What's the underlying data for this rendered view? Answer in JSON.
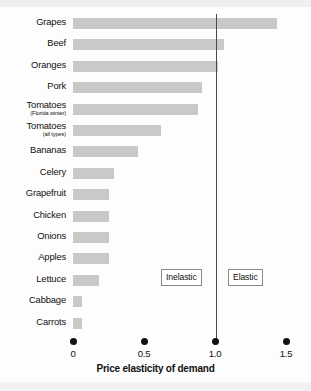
{
  "chart_data": {
    "type": "bar",
    "orientation": "horizontal",
    "title": "",
    "xlabel": "Price elasticity of demand",
    "ylabel": "",
    "xlim": [
      0,
      1.5
    ],
    "xticks": [
      "0",
      "0.5",
      "1.0",
      "1.5"
    ],
    "xtick_values": [
      0,
      0.5,
      1.0,
      1.5
    ],
    "grid": false,
    "legend": null,
    "bar_color": "#c9c9c9",
    "reference_line": {
      "value": 1.0,
      "color": "#4a4a4a",
      "label": "unit elasticity"
    },
    "annotations": [
      {
        "text": "Inelastic",
        "x": 0.62
      },
      {
        "text": "Elastic",
        "x": 1.1
      }
    ],
    "categories": [
      "Grapes",
      "Beef",
      "Oranges",
      "Pork",
      "Tomatoes (Florida winter)",
      "Tomatoes (all types)",
      "Bananas",
      "Celery",
      "Grapefruit",
      "Chicken",
      "Onions",
      "Apples",
      "Lettuce",
      "Cabbage",
      "Carrots"
    ],
    "values": [
      1.44,
      1.06,
      1.02,
      0.91,
      0.88,
      0.62,
      0.46,
      0.29,
      0.25,
      0.25,
      0.25,
      0.25,
      0.18,
      0.06,
      0.06
    ]
  },
  "rows": [
    {
      "label": "Grapes",
      "sub": "",
      "value": 1.44
    },
    {
      "label": "Beef",
      "sub": "",
      "value": 1.06
    },
    {
      "label": "Oranges",
      "sub": "",
      "value": 1.02
    },
    {
      "label": "Pork",
      "sub": "",
      "value": 0.91
    },
    {
      "label": "Tomatoes",
      "sub": "(Florida winter)",
      "value": 0.88
    },
    {
      "label": "Tomatoes",
      "sub": "(all types)",
      "value": 0.62
    },
    {
      "label": "Bananas",
      "sub": "",
      "value": 0.46
    },
    {
      "label": "Celery",
      "sub": "",
      "value": 0.29
    },
    {
      "label": "Grapefruit",
      "sub": "",
      "value": 0.25
    },
    {
      "label": "Chicken",
      "sub": "",
      "value": 0.25
    },
    {
      "label": "Onions",
      "sub": "",
      "value": 0.25
    },
    {
      "label": "Apples",
      "sub": "",
      "value": 0.25
    },
    {
      "label": "Lettuce",
      "sub": "",
      "value": 0.18
    },
    {
      "label": "Cabbage",
      "sub": "",
      "value": 0.06
    },
    {
      "label": "Carrots",
      "sub": "",
      "value": 0.06
    }
  ],
  "axis": {
    "title": "Price elasticity of demand",
    "ticks": [
      "0",
      "0.5",
      "1.0",
      "1.5"
    ]
  },
  "annotations": {
    "inelastic": "Inelastic",
    "elastic": "Elastic"
  }
}
